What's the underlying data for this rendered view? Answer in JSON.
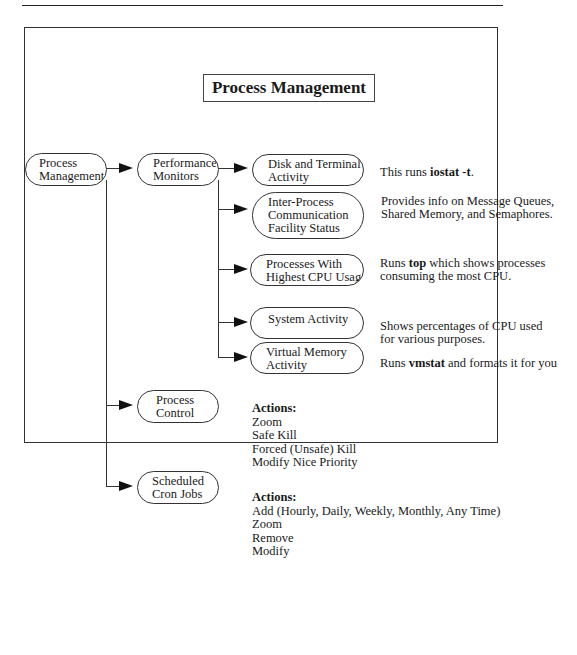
{
  "title": "Process Management",
  "nodes": {
    "root": "Process Management",
    "perf": "Performance Monitors",
    "disk": "Disk and Terminal Activity",
    "ipc": "Inter-Process Communication Facility Status",
    "top": "Processes With Highest CPU Usage",
    "sys": "System Activity",
    "vm": "Virtual Memory Activity",
    "control": "Process Control",
    "cron": "Scheduled Cron Jobs"
  },
  "node_lines": {
    "root": [
      "Process",
      "Management"
    ],
    "perf": [
      "Performance",
      "Monitors"
    ],
    "disk": [
      "Disk and Terminal",
      "Activity"
    ],
    "ipc": [
      "Inter-Process",
      "Communication",
      "Facility Status"
    ],
    "top": [
      "Processes With",
      "Highest CPU Usage"
    ],
    "sys": [
      "System Activity"
    ],
    "vm": [
      "Virtual Memory",
      "Activity"
    ],
    "control": [
      "Process",
      "Control"
    ],
    "cron": [
      "Scheduled",
      "Cron Jobs"
    ]
  },
  "descriptions": {
    "disk": {
      "pre": "This runs ",
      "bold": "iostat -t",
      "post": "."
    },
    "ipc": {
      "line1": "Provides info on Message Queues,",
      "line2": "Shared Memory, and Semaphores."
    },
    "top": {
      "pre": "Runs ",
      "bold": "top",
      "post": " which shows processes",
      "line2": "consuming the most CPU."
    },
    "sys": {
      "line1": "Shows percentages of CPU used",
      "line2": "for various purposes."
    },
    "vm": {
      "pre": "Runs ",
      "bold": "vmstat",
      "post": " and formats it for you"
    }
  },
  "control_actions": {
    "header": "Actions:",
    "items": [
      "Zoom",
      "Safe Kill",
      "Forced (Unsafe) Kill",
      "Modify Nice Priority"
    ]
  },
  "cron_actions": {
    "header": "Actions:",
    "items": [
      "Add (Hourly, Daily, Weekly, Monthly, Any Time)",
      "Zoom",
      "Remove",
      "Modify"
    ]
  }
}
